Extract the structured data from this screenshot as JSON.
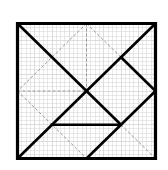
{
  "diagram": {
    "type": "tangram-square",
    "title": "",
    "units": 8,
    "grid_subdivisions": 32,
    "bounds_px": {
      "x0": 17.5,
      "y0": 23.5,
      "x1": 155.5,
      "y1": 158.5
    },
    "colors": {
      "background": "#ffffff",
      "grid": "#d4d4d4",
      "solid": "#000000",
      "dashed": "#9a9a9a"
    },
    "outer_square": [
      [
        0,
        0
      ],
      [
        8,
        0
      ],
      [
        8,
        8
      ],
      [
        0,
        8
      ]
    ],
    "solid_lines": [
      {
        "id": "diag-tl-to-horizontal",
        "from": [
          0,
          0
        ],
        "to": [
          6,
          6
        ]
      },
      {
        "id": "diag-bl-to-tr",
        "from": [
          0,
          8
        ],
        "to": [
          8,
          0
        ]
      },
      {
        "id": "upper-right-to-right-mid",
        "from": [
          6,
          2
        ],
        "to": [
          8,
          4
        ]
      },
      {
        "id": "right-mid-to-bottom-mid",
        "from": [
          8,
          4
        ],
        "to": [
          4,
          8
        ]
      },
      {
        "id": "horizontal-bar",
        "from": [
          2,
          6
        ],
        "to": [
          6,
          6
        ]
      }
    ],
    "dashed_lines": [
      {
        "id": "top-mid-to-left-mid",
        "from": [
          4,
          0
        ],
        "to": [
          0,
          4
        ]
      },
      {
        "id": "top-mid-to-center",
        "from": [
          4,
          0
        ],
        "to": [
          4,
          4
        ]
      },
      {
        "id": "top-mid-to-upper-right",
        "from": [
          4,
          0
        ],
        "to": [
          6,
          2
        ]
      },
      {
        "id": "left-mid-to-center",
        "from": [
          0,
          4
        ],
        "to": [
          4,
          4
        ]
      },
      {
        "id": "left-mid-to-bottom-mid",
        "from": [
          0,
          4
        ],
        "to": [
          4,
          8
        ]
      },
      {
        "id": "horizontal-to-br",
        "from": [
          6,
          6
        ],
        "to": [
          8,
          8
        ]
      }
    ]
  }
}
